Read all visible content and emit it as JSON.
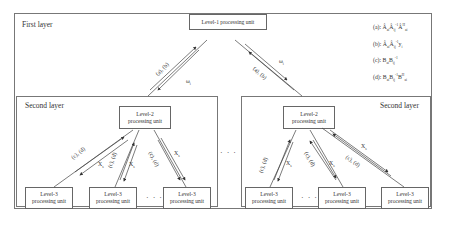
{
  "first_layer": {
    "label": "First layer",
    "level1_unit": "Level-1 processing unit",
    "legend": [
      {
        "key": "(a):",
        "expr": "Â_ai Â_ij^-1 Â_ai^H"
      },
      {
        "key": "(b):",
        "expr": "Â_ai Â_ij^-1 y_i"
      },
      {
        "key": "(c):",
        "expr": "B_ai B_ij^-1"
      },
      {
        "key": "(d):",
        "expr": "B_ai B_ij^-1 B_ai^H"
      }
    ],
    "edge_left": {
      "up_label": "(a), (b)",
      "down_label": "ω_i"
    },
    "edge_right": {
      "up_label": "(a), (b)",
      "down_label": "ω_i"
    }
  },
  "left_second_layer": {
    "label": "Second layer",
    "level2_unit": {
      "line1": "Level-2",
      "line2": "processing unit"
    },
    "level3_units": [
      {
        "line1": "Level-3",
        "line2": "processing unit"
      },
      {
        "line1": "Level-3",
        "line2": "processing unit"
      },
      {
        "line1": "Level-3",
        "line2": "processing unit"
      }
    ],
    "edges": [
      {
        "up_label": "(c), (d)",
        "down_label": "X_s"
      },
      {
        "up_label": "(c), (d)",
        "down_label": "X_s"
      },
      {
        "up_label": "(c), (d)",
        "down_label": "X_s"
      }
    ],
    "ellipsis": "· · ·"
  },
  "right_second_layer": {
    "label": "Second layer",
    "level2_unit": {
      "line1": "Level-2",
      "line2": "processing unit"
    },
    "level3_units": [
      {
        "line1": "Level-3",
        "line2": "processing unit"
      },
      {
        "line1": "Level-3",
        "line2": "processing unit"
      },
      {
        "line1": "Level-3",
        "line2": "processing unit"
      }
    ],
    "edges": [
      {
        "up_label": "(c), (d)",
        "down_label": "X_s"
      },
      {
        "up_label": "(c), (d)",
        "down_label": "X_s"
      },
      {
        "up_label": "(c), (d)",
        "down_label": "X_s"
      }
    ],
    "ellipsis": "· · ·"
  },
  "between_layers_ellipsis": "· · ·"
}
